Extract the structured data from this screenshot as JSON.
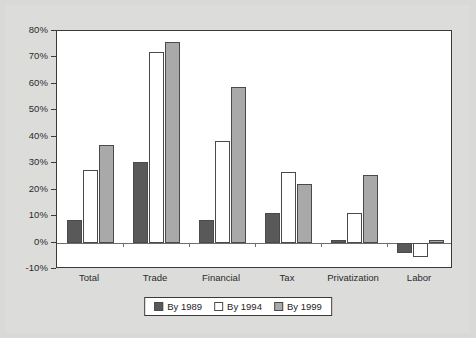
{
  "chart_data": {
    "type": "bar",
    "title": "",
    "xlabel": "",
    "ylabel": "",
    "categories": [
      "Total",
      "Trade",
      "Financial",
      "Tax",
      "Privatization",
      "Labor"
    ],
    "series": [
      {
        "name": "By 1989",
        "color": "#595959",
        "values": [
          8.5,
          30.5,
          8.5,
          11.0,
          1.0,
          -4.0
        ]
      },
      {
        "name": "By 1994",
        "color": "#ffffff",
        "values": [
          27.5,
          72.0,
          38.5,
          26.5,
          11.0,
          -5.5
        ]
      },
      {
        "name": "By 1999",
        "color": "#a9a9a9",
        "values": [
          37.0,
          76.0,
          59.0,
          22.0,
          25.5,
          1.0
        ]
      }
    ],
    "ylim": [
      -10,
      80
    ],
    "ytick_values": [
      80,
      70,
      60,
      50,
      40,
      30,
      20,
      10,
      0,
      -10
    ],
    "ytick_labels": [
      "80%",
      "70%",
      "60%",
      "50%",
      "40%",
      "30%",
      "20%",
      "10%",
      "0%",
      "-10%"
    ],
    "grid": false,
    "legend_position": "bottom-center",
    "zero_line": true
  },
  "legend": {
    "items": [
      {
        "label": "By 1989",
        "swatch": "s0"
      },
      {
        "label": "By 1994",
        "swatch": "s1"
      },
      {
        "label": "By 1999",
        "swatch": "s2"
      }
    ]
  }
}
